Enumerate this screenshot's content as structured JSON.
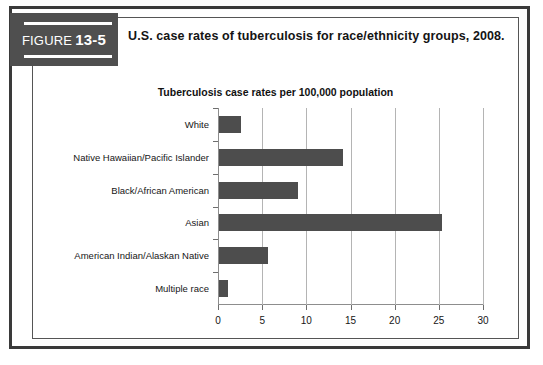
{
  "figure": {
    "badge_word": "FIGURE",
    "badge_number": "13-5",
    "caption": "U.S. case rates of tuberculosis for race/ethnicity groups, 2008."
  },
  "colors": {
    "badge_background": "#4f4f4f",
    "bar": "#4d4d4d",
    "frame": "#3a3a3a",
    "panel_border": "#555555",
    "gridline": "#b4b4b4",
    "axis": "#8d8d8d",
    "text": "#161616"
  },
  "chart_data": {
    "type": "bar",
    "orientation": "horizontal",
    "title": "Tuberculosis case rates per 100,000 population",
    "xlabel": "",
    "ylabel": "",
    "categories": [
      "White",
      "Native Hawaiian/Pacific Islander",
      "Black/African American",
      "Asian",
      "American Indian/Alaskan Native",
      "Multiple race"
    ],
    "values": [
      2.5,
      14.0,
      8.9,
      25.3,
      5.6,
      1.0
    ],
    "xlim": [
      0,
      30
    ],
    "xticks": [
      0,
      5,
      10,
      15,
      20,
      25,
      30
    ],
    "xtick_labels": [
      "0",
      "5",
      "10",
      "15",
      "20",
      "25",
      "30"
    ],
    "grid": true,
    "grid_axis": "x",
    "legend": false,
    "legend_position": "none"
  }
}
